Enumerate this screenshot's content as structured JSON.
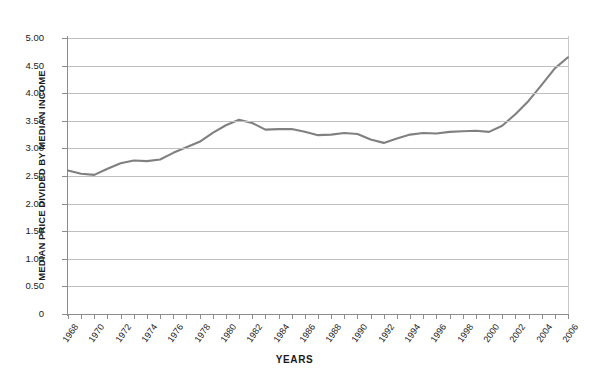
{
  "title_clipped": "HOUSE PRICE RATIO OF ALTERNATIVE HOUSING MARKETS",
  "colors": {
    "line": "#808080",
    "grid": "#bfbfbf",
    "axis": "#8d8d8d",
    "text": "#1a1a1a",
    "background": "#ffffff"
  },
  "chart_data": {
    "type": "line",
    "title": "HOUSE PRICE RATIO OF ALTERNATIVE HOUSING MARKETS",
    "xlabel": "YEARS",
    "ylabel": "MEDIAN PRICE DIVIDED BY MEDIAN INCOME",
    "xlim": [
      1968,
      2006
    ],
    "ylim": [
      0,
      5.0
    ],
    "grid": true,
    "legend": "none",
    "ytick_labels": [
      "0",
      "0.50",
      "1.00",
      "1.50",
      "2.00",
      "2.50",
      "3.00",
      "3.50",
      "4.00",
      "4.50",
      "5.00"
    ],
    "ytick_values": [
      0,
      0.5,
      1.0,
      1.5,
      2.0,
      2.5,
      3.0,
      3.5,
      4.0,
      4.5,
      5.0
    ],
    "xtick_labels": [
      "1968",
      "1970",
      "1972",
      "1974",
      "1976",
      "1978",
      "1980",
      "1982",
      "1984",
      "1986",
      "1988",
      "1990",
      "1992",
      "1994",
      "1996",
      "1998",
      "2000",
      "2002",
      "2004",
      "2006"
    ],
    "xtick_label_step": 2,
    "xtick_minor_step": 1,
    "x": [
      1968,
      1969,
      1970,
      1971,
      1972,
      1973,
      1974,
      1975,
      1976,
      1977,
      1978,
      1979,
      1980,
      1981,
      1982,
      1983,
      1984,
      1985,
      1986,
      1987,
      1988,
      1989,
      1990,
      1991,
      1992,
      1993,
      1994,
      1995,
      1996,
      1997,
      1998,
      1999,
      2000,
      2001,
      2002,
      2003,
      2004,
      2005,
      2006
    ],
    "values": [
      2.6,
      2.54,
      2.52,
      2.63,
      2.73,
      2.78,
      2.77,
      2.8,
      2.92,
      3.02,
      3.12,
      3.28,
      3.42,
      3.52,
      3.46,
      3.34,
      3.35,
      3.35,
      3.3,
      3.24,
      3.25,
      3.28,
      3.26,
      3.16,
      3.1,
      3.18,
      3.25,
      3.28,
      3.27,
      3.3,
      3.31,
      3.32,
      3.3,
      3.41,
      3.62,
      3.86,
      4.15,
      4.45,
      4.65
    ],
    "series": [
      {
        "name": "Median price divided by median income",
        "values": [
          2.6,
          2.54,
          2.52,
          2.63,
          2.73,
          2.78,
          2.77,
          2.8,
          2.92,
          3.02,
          3.12,
          3.28,
          3.42,
          3.52,
          3.46,
          3.34,
          3.35,
          3.35,
          3.3,
          3.24,
          3.25,
          3.28,
          3.26,
          3.16,
          3.1,
          3.18,
          3.25,
          3.28,
          3.27,
          3.3,
          3.31,
          3.32,
          3.3,
          3.41,
          3.62,
          3.86,
          4.15,
          4.45,
          4.65
        ]
      }
    ]
  }
}
